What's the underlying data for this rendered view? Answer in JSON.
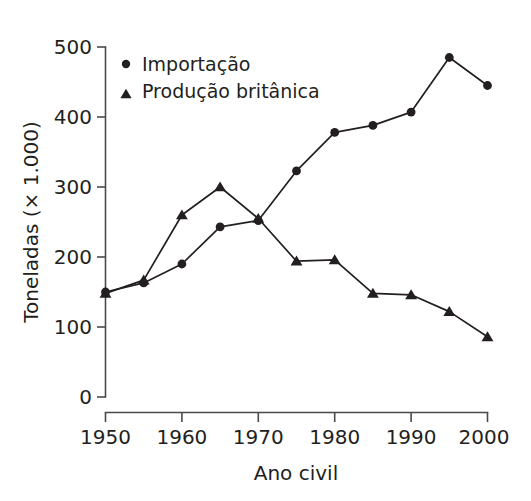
{
  "chart_data": {
    "type": "line",
    "title": "",
    "xlabel": "Ano civil",
    "ylabel": "Toneladas (× 1.000)",
    "xlim": [
      1950,
      2000
    ],
    "ylim": [
      0,
      500
    ],
    "xticks": [
      "1950",
      "1960",
      "1970",
      "1980",
      "1990",
      "2000"
    ],
    "xtick_values": [
      1950,
      1960,
      1970,
      1980,
      1990,
      2000
    ],
    "yticks": [
      "0",
      "100",
      "200",
      "300",
      "400",
      "500"
    ],
    "ytick_values": [
      0,
      100,
      200,
      300,
      400,
      500
    ],
    "grid": false,
    "legend_position": "top-left",
    "x": [
      1950,
      1955,
      1960,
      1965,
      1970,
      1975,
      1980,
      1985,
      1990,
      1995,
      2000
    ],
    "series": [
      {
        "name": "Importação",
        "marker": "circle",
        "color": "#231f20",
        "values": [
          150,
          163,
          190,
          243,
          252,
          323,
          378,
          388,
          407,
          485,
          445
        ]
      },
      {
        "name": "Produção britânica",
        "marker": "triangle",
        "color": "#231f20",
        "values": [
          148,
          167,
          260,
          300,
          255,
          194,
          196,
          148,
          146,
          122,
          86
        ]
      }
    ]
  },
  "legend": {
    "items": [
      {
        "label": "Importação",
        "marker": "circle"
      },
      {
        "label": "Produção britânica",
        "marker": "triangle"
      }
    ]
  },
  "axes": {
    "x_title": "Ano civil",
    "y_title": "Toneladas (× 1.000)"
  }
}
